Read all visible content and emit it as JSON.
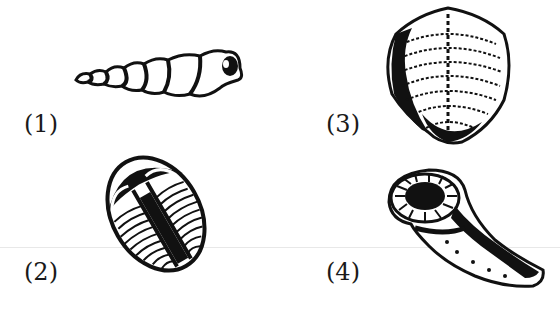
{
  "figures": [
    {
      "label": "(1)",
      "subject": "high-spired gastropod shell fossil"
    },
    {
      "label": "(2)",
      "subject": "trilobite fossil"
    },
    {
      "label": "(3)",
      "subject": "brachiopod shell fossil"
    },
    {
      "label": "(4)",
      "subject": "horn coral fossil"
    }
  ],
  "colors": {
    "ink": "#111111",
    "background": "#ffffff"
  }
}
